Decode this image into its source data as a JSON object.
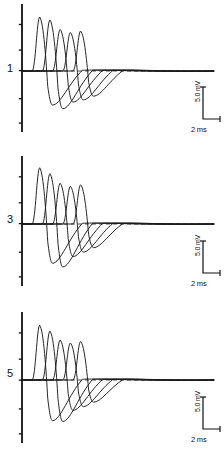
{
  "figure": {
    "type": "electrophysiology-trace-figure",
    "background_color": "#ffffff",
    "trace_color": "#1a1a1a",
    "axis_color": "#111111",
    "baseline_style": "dashed",
    "panel_count": 3
  },
  "panels": [
    {
      "label": "1",
      "scalebar": {
        "vertical": "5.0 mV",
        "horizontal": "2 ms"
      }
    },
    {
      "label": "3",
      "scalebar": {
        "vertical": "5.0 mV",
        "horizontal": "2 ms"
      }
    },
    {
      "label": "5",
      "scalebar": {
        "vertical": "5.0 mV",
        "horizontal": "2 ms"
      }
    }
  ],
  "chart_data": {
    "type": "line",
    "title": "",
    "xlabel": "",
    "ylabel": "",
    "grid": false,
    "legend": "none",
    "scale_vertical_value": 5.0,
    "scale_vertical_unit": "mV",
    "scale_horizontal_value": 2,
    "scale_horizontal_unit": "ms",
    "panel_labels": [
      "1",
      "3",
      "5"
    ],
    "traces_per_panel": 5,
    "x_axis_range_ms": [
      0,
      20
    ],
    "panels": [
      {
        "label": "1",
        "series": [
          {
            "name": "trace-1",
            "onset_ms": 1.1,
            "peak_ms": 1.9,
            "peak_mV": 7.3,
            "trough_ms": 3.3,
            "trough_mV": -4.6,
            "decay_ms": 6.5
          },
          {
            "name": "trace-2",
            "onset_ms": 2.2,
            "peak_ms": 3.0,
            "peak_mV": 6.9,
            "trough_ms": 4.4,
            "trough_mV": -5.1,
            "decay_ms": 7.6
          },
          {
            "name": "trace-3",
            "onset_ms": 3.3,
            "peak_ms": 4.1,
            "peak_mV": 5.6,
            "trough_ms": 5.5,
            "trough_mV": -4.2,
            "decay_ms": 8.7
          },
          {
            "name": "trace-4",
            "onset_ms": 4.4,
            "peak_ms": 5.2,
            "peak_mV": 5.2,
            "trough_ms": 6.6,
            "trough_mV": -3.9,
            "decay_ms": 9.8
          },
          {
            "name": "trace-5",
            "onset_ms": 5.5,
            "peak_ms": 6.3,
            "peak_mV": 5.4,
            "trough_ms": 7.7,
            "trough_mV": -3.4,
            "decay_ms": 10.9
          }
        ]
      },
      {
        "label": "3",
        "series": [
          {
            "name": "trace-1",
            "onset_ms": 1.1,
            "peak_ms": 1.9,
            "peak_mV": 7.6,
            "trough_ms": 3.3,
            "trough_mV": -5.3,
            "decay_ms": 6.5
          },
          {
            "name": "trace-2",
            "onset_ms": 2.2,
            "peak_ms": 3.0,
            "peak_mV": 6.8,
            "trough_ms": 4.4,
            "trough_mV": -5.8,
            "decay_ms": 7.6
          },
          {
            "name": "trace-3",
            "onset_ms": 3.3,
            "peak_ms": 4.1,
            "peak_mV": 5.5,
            "trough_ms": 5.5,
            "trough_mV": -4.4,
            "decay_ms": 8.7
          },
          {
            "name": "trace-4",
            "onset_ms": 4.4,
            "peak_ms": 5.2,
            "peak_mV": 5.1,
            "trough_ms": 6.6,
            "trough_mV": -3.8,
            "decay_ms": 9.8
          },
          {
            "name": "trace-5",
            "onset_ms": 5.5,
            "peak_ms": 6.3,
            "peak_mV": 5.3,
            "trough_ms": 7.7,
            "trough_mV": -3.2,
            "decay_ms": 10.9
          }
        ]
      },
      {
        "label": "5",
        "series": [
          {
            "name": "trace-1",
            "onset_ms": 1.1,
            "peak_ms": 1.9,
            "peak_mV": 7.4,
            "trough_ms": 3.3,
            "trough_mV": -5.5,
            "decay_ms": 6.5
          },
          {
            "name": "trace-2",
            "onset_ms": 2.2,
            "peak_ms": 3.0,
            "peak_mV": 6.6,
            "trough_ms": 4.4,
            "trough_mV": -5.6,
            "decay_ms": 7.6
          },
          {
            "name": "trace-3",
            "onset_ms": 3.3,
            "peak_ms": 4.1,
            "peak_mV": 5.4,
            "trough_ms": 5.5,
            "trough_mV": -4.1,
            "decay_ms": 8.7
          },
          {
            "name": "trace-4",
            "onset_ms": 4.4,
            "peak_ms": 5.2,
            "peak_mV": 5.0,
            "trough_ms": 6.6,
            "trough_mV": -3.6,
            "decay_ms": 9.8
          },
          {
            "name": "trace-5",
            "onset_ms": 5.5,
            "peak_ms": 6.3,
            "peak_mV": 5.2,
            "trough_ms": 7.7,
            "trough_mV": -3.0,
            "decay_ms": 10.9
          }
        ]
      }
    ]
  }
}
